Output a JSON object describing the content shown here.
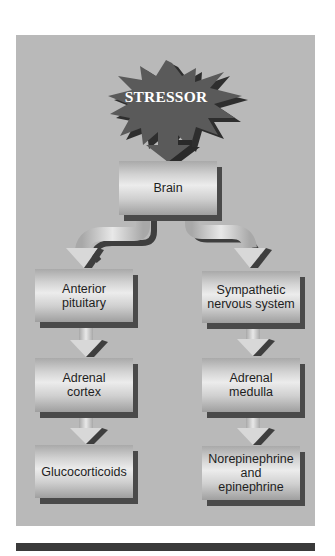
{
  "diagram": {
    "stressor": {
      "label": "STRESSOR",
      "color": "#5a5a5a"
    },
    "nodes": {
      "brain": "Brain",
      "anterior_pituitary": [
        "Anterior",
        "pituitary"
      ],
      "sympathetic_nervous_system": [
        "Sympathetic",
        "nervous system"
      ],
      "adrenal_cortex": [
        "Adrenal",
        "cortex"
      ],
      "adrenal_medulla": [
        "Adrenal",
        "medulla"
      ],
      "glucocorticoids": "Glucocorticoids",
      "norepinephrine_epinephrine": [
        "Norepinephrine",
        "and",
        "epinephrine"
      ]
    },
    "edges": [
      [
        "STRESSOR",
        "Brain"
      ],
      [
        "Brain",
        "Anterior pituitary"
      ],
      [
        "Brain",
        "Sympathetic nervous system"
      ],
      [
        "Anterior pituitary",
        "Adrenal cortex"
      ],
      [
        "Adrenal cortex",
        "Glucocorticoids"
      ],
      [
        "Sympathetic nervous system",
        "Adrenal medulla"
      ],
      [
        "Adrenal medulla",
        "Norepinephrine and epinephrine"
      ]
    ],
    "colors": {
      "panel": "#b9b9b9",
      "shadow": "#4a4a4a",
      "bottom_bar": "#3a3a3a"
    }
  }
}
